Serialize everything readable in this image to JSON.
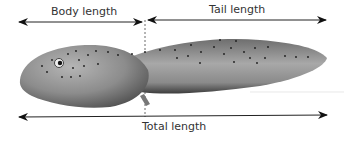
{
  "diagram": {
    "labels": {
      "body_length": "Body length",
      "tail_length": "Tail length",
      "total_length": "Total length"
    },
    "colors": {
      "line": "#222222",
      "text": "#333333",
      "body": "#8a8a8a"
    }
  }
}
